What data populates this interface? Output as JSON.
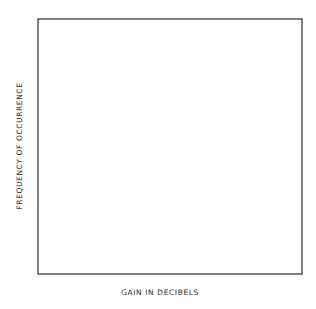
{
  "chart_data": {
    "type": "bar",
    "subtype": "histogram",
    "title": "",
    "xlabel": "GAIN IN DECIBELS",
    "ylabel": "FREQUENCY OF OCCURRENCE",
    "xlim": [
      19.95,
      20.27
    ],
    "ylim": [
      0,
      20
    ],
    "bin_width": 0.02,
    "x_ticks": [
      20.0,
      20.1,
      20.2
    ],
    "x_tick_labels": [
      "20.00",
      "20.10",
      "20.20"
    ],
    "y_ticks": [
      0,
      5,
      10,
      15,
      20
    ],
    "y_tick_labels": [
      "0",
      "5",
      "10",
      "15",
      "20"
    ],
    "y_minor_tick_step": 1,
    "grid": false,
    "legend": null,
    "bins_left_edges": [
      19.95,
      19.97,
      19.99,
      20.01,
      20.03,
      20.05,
      20.07,
      20.09,
      20.11,
      20.13,
      20.15,
      20.17,
      20.19,
      20.21,
      20.23,
      20.25
    ],
    "series": [
      {
        "name": "total (solid outline)",
        "values": [
          1,
          1,
          1,
          2,
          2,
          8,
          11,
          17.5,
          19,
          12,
          8.5,
          3.5,
          2.5,
          1,
          0.5,
          0.5
        ]
      },
      {
        "name": "dashed inner level",
        "values": [
          null,
          null,
          null,
          null,
          null,
          null,
          null,
          17,
          null,
          null,
          8,
          3,
          2,
          null,
          0.5,
          0.5
        ]
      }
    ],
    "fill": "diagonal hatch"
  },
  "colors": {
    "ink": "#2a2a2a",
    "background": "#ffffff",
    "hatch": "#6a6a6a"
  }
}
